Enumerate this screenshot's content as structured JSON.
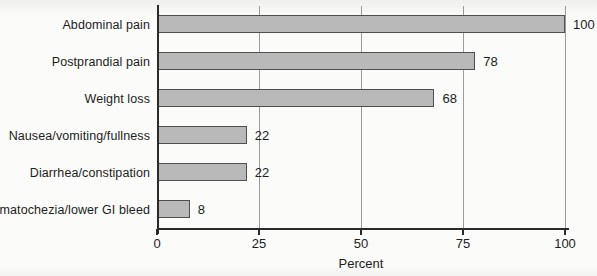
{
  "chart_data": {
    "type": "bar",
    "orientation": "horizontal",
    "categories": [
      "Abdominal pain",
      "Postprandial pain",
      "Weight loss",
      "Nausea/vomiting/fullness",
      "Diarrhea/constipation",
      "Hematochezia/lower GI bleed"
    ],
    "values": [
      100,
      78,
      68,
      22,
      22,
      8
    ],
    "value_labels": [
      "100",
      "78",
      "68",
      "22",
      "22",
      "8"
    ],
    "title": "",
    "xlabel": "Percent",
    "ylabel": "",
    "xlim": [
      0,
      100
    ],
    "xticks": [
      0,
      25,
      50,
      75,
      100
    ],
    "xtick_labels": [
      "0",
      "25",
      "50",
      "75",
      "100"
    ],
    "grid": true,
    "legend": "none"
  },
  "colors": {
    "bar_fill": "#b9b9b9",
    "bar_border": "#4f4f4f",
    "gridline": "#9b9b9b",
    "axis": "#2a2a2a",
    "text": "#1d1d1d",
    "background": "#fbfbf9"
  }
}
